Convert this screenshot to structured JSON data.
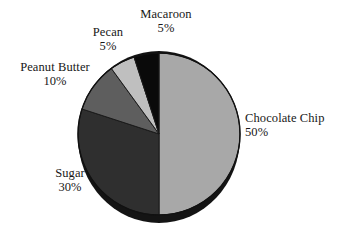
{
  "chart_data": {
    "type": "pie",
    "title": "",
    "subtitle": "",
    "xlabel": "",
    "ylabel": "",
    "legend_position": "none",
    "grid": false,
    "labels_outside": true,
    "start_angle_deg": 0,
    "direction": "clockwise",
    "categories": [
      "Chocolate Chip",
      "Sugar",
      "Peanut Butter",
      "Pecan",
      "Macaroon"
    ],
    "values": [
      50,
      30,
      10,
      5,
      5
    ],
    "value_unit": "%",
    "colors": [
      "#a8a8a8",
      "#2f2f2f",
      "#5e5e5e",
      "#bfbfbf",
      "#0a0a0a"
    ],
    "slices": [
      {
        "name": "Chocolate Chip",
        "value": 50,
        "label": "Chocolate Chip",
        "value_label": "50%",
        "color": "#a8a8a8",
        "start_deg": 0,
        "end_deg": 180
      },
      {
        "name": "Sugar",
        "value": 30,
        "label": "Sugar",
        "value_label": "30%",
        "color": "#2f2f2f",
        "start_deg": 180,
        "end_deg": 288
      },
      {
        "name": "Peanut Butter",
        "value": 10,
        "label": "Peanut Butter",
        "value_label": "10%",
        "color": "#5e5e5e",
        "start_deg": 288,
        "end_deg": 324
      },
      {
        "name": "Pecan",
        "value": 5,
        "label": "Pecan",
        "value_label": "5%",
        "color": "#bfbfbf",
        "start_deg": 324,
        "end_deg": 342
      },
      {
        "name": "Macaroon",
        "value": 5,
        "label": "Macaroon",
        "value_label": "5%",
        "color": "#0a0a0a",
        "start_deg": 342,
        "end_deg": 360
      }
    ]
  },
  "figure": {
    "background": "#ffffff",
    "outline_color": "#111111",
    "shadow_color": "#111111"
  }
}
